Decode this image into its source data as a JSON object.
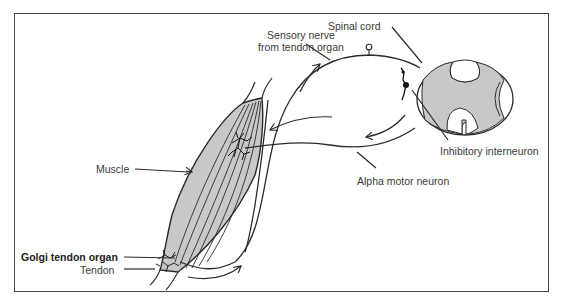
{
  "diagram": {
    "labels": {
      "sensory_nerve_line1": "Sensory nerve",
      "sensory_nerve_line2": "from tendon organ",
      "spinal_cord": "Spinal cord",
      "inhibitory_interneuron": "Inhibitory interneuron",
      "alpha_motor_neuron": "Alpha motor neuron",
      "muscle": "Muscle",
      "golgi_tendon_organ": "Golgi tendon organ",
      "tendon": "Tendon"
    },
    "colors": {
      "line": "#2a2a2a",
      "fill_gray": "#c8c8c8",
      "frame": "#4a4a4a",
      "background": "#ffffff"
    }
  }
}
